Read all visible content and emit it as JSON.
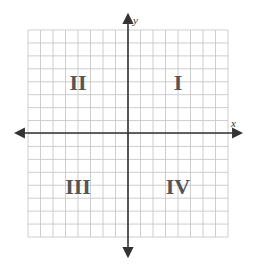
{
  "diagram": {
    "type": "coordinate-plane",
    "axes": {
      "x_label": "x",
      "y_label": "y"
    },
    "grid": {
      "columns": 16,
      "rows": 16,
      "line_color": "#c8c8c8",
      "axis_color": "#333333"
    },
    "quadrants": [
      {
        "id": "I",
        "label": "I"
      },
      {
        "id": "II",
        "label": "II"
      },
      {
        "id": "III",
        "label": "III"
      },
      {
        "id": "IV",
        "label": "IV"
      }
    ]
  }
}
